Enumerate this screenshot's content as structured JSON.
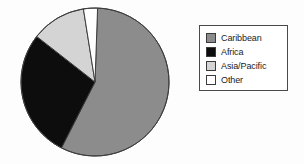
{
  "chart_data": {
    "type": "pie",
    "title": "",
    "subtitle": "",
    "xlabel": "",
    "ylabel": "",
    "grid": false,
    "legend_position": "right",
    "start_angle_deg": 357,
    "direction": "clockwise",
    "categories": [
      "Caribbean",
      "Africa",
      "Asia/Pacific",
      "Other"
    ],
    "values": [
      57,
      28,
      12,
      3
    ],
    "unit": "percent",
    "colors": [
      "#8c8c8c",
      "#0d0d0d",
      "#d4d4d4",
      "#ffffff"
    ],
    "slices": [
      {
        "label": "Caribbean",
        "value": 57,
        "color": "#8c8c8c",
        "start_deg": 2,
        "end_deg": 207
      },
      {
        "label": "Africa",
        "value": 28,
        "color": "#0d0d0d",
        "start_deg": 207,
        "end_deg": 308
      },
      {
        "label": "Asia/Pacific",
        "value": 12,
        "color": "#d4d4d4",
        "start_deg": 308,
        "end_deg": 351
      },
      {
        "label": "Other",
        "value": 3,
        "color": "#ffffff",
        "start_deg": 351,
        "end_deg": 362
      }
    ]
  },
  "pie": {
    "center_x": 77,
    "center_y": 75,
    "radius": 74,
    "outline_color": "#3d3d3d",
    "separator_color": "#3d3d3d"
  },
  "legend": {
    "border_color": "#4a4a4a",
    "background": "#ffffff",
    "items": [
      {
        "label": "Caribbean",
        "swatch": "#8c8c8c"
      },
      {
        "label": "Africa",
        "swatch": "#0d0d0d"
      },
      {
        "label": "Asia/Pacific",
        "swatch": "#d4d4d4"
      },
      {
        "label": "Other",
        "swatch": "#ffffff"
      }
    ]
  },
  "page": {
    "background": "#fdfdfd"
  }
}
